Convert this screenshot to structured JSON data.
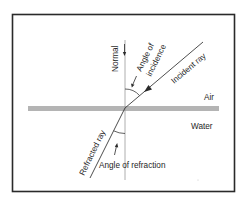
{
  "diagram": {
    "media": {
      "upper": "Air",
      "lower": "Water"
    },
    "labels": {
      "normal": "Normal",
      "angle_of_incidence_line1": "Angle of",
      "angle_of_incidence_line2": "incidence",
      "incident_ray": "Incident ray",
      "refracted_ray": "Refracted ray",
      "angle_of_refraction": "Angle of refraction"
    },
    "colors": {
      "frame": "#2a2a2a",
      "surface": "#b4b4b4",
      "line": "#3a3a3a",
      "text": "#1e1e1e",
      "background": "#ffffff"
    }
  }
}
